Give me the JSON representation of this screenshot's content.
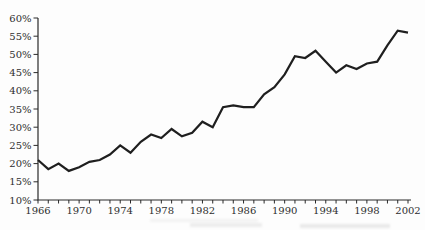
{
  "chart_data": {
    "type": "line",
    "title": "",
    "subtitle": "",
    "xlabel": "",
    "ylabel": "",
    "grid": false,
    "legend": "none",
    "xlim": [
      1966,
      2002
    ],
    "ylim": [
      10,
      60
    ],
    "x": [
      1966,
      1967,
      1968,
      1969,
      1970,
      1971,
      1972,
      1973,
      1974,
      1975,
      1976,
      1977,
      1978,
      1979,
      1980,
      1981,
      1982,
      1983,
      1984,
      1985,
      1986,
      1987,
      1988,
      1989,
      1990,
      1991,
      1992,
      1993,
      1994,
      1995,
      1996,
      1997,
      1998,
      1999,
      2000,
      2001,
      2002
    ],
    "values": [
      21,
      18.5,
      20,
      18,
      19,
      20.5,
      21,
      22.5,
      25,
      23,
      26,
      28,
      27,
      29.5,
      27.5,
      28.5,
      31.5,
      30,
      35.5,
      36,
      35.5,
      35.5,
      39,
      41,
      44.5,
      49.5,
      49,
      51,
      48,
      45,
      47,
      46,
      47.5,
      48,
      52.5,
      56.5,
      56
    ],
    "y_ticks": [
      {
        "value": 60,
        "label": "60%"
      },
      {
        "value": 55,
        "label": "55%"
      },
      {
        "value": 50,
        "label": "50%"
      },
      {
        "value": 45,
        "label": "45%"
      },
      {
        "value": 40,
        "label": "40%"
      },
      {
        "value": 35,
        "label": "35%"
      },
      {
        "value": 30,
        "label": "30%"
      },
      {
        "value": 25,
        "label": "25%"
      },
      {
        "value": 20,
        "label": "20%"
      },
      {
        "value": 15,
        "label": "15%"
      },
      {
        "value": 10,
        "label": "10%"
      }
    ],
    "x_minor_tick_every_years": 1,
    "x_labeled_ticks": [
      {
        "value": 1966,
        "label": "1966"
      },
      {
        "value": 1970,
        "label": "1970"
      },
      {
        "value": 1974,
        "label": "1974"
      },
      {
        "value": 1978,
        "label": "1978"
      },
      {
        "value": 1982,
        "label": "1982"
      },
      {
        "value": 1986,
        "label": "1986"
      },
      {
        "value": 1990,
        "label": "1990"
      },
      {
        "value": 1994,
        "label": "1994"
      },
      {
        "value": 1998,
        "label": "1998"
      },
      {
        "value": 2002,
        "label": "2002"
      }
    ],
    "colors": {
      "line": "#1f1f1f",
      "axis": "#2a2a2a",
      "tick_labels": "#2e2e2e",
      "background": "#fdfdfd"
    }
  }
}
